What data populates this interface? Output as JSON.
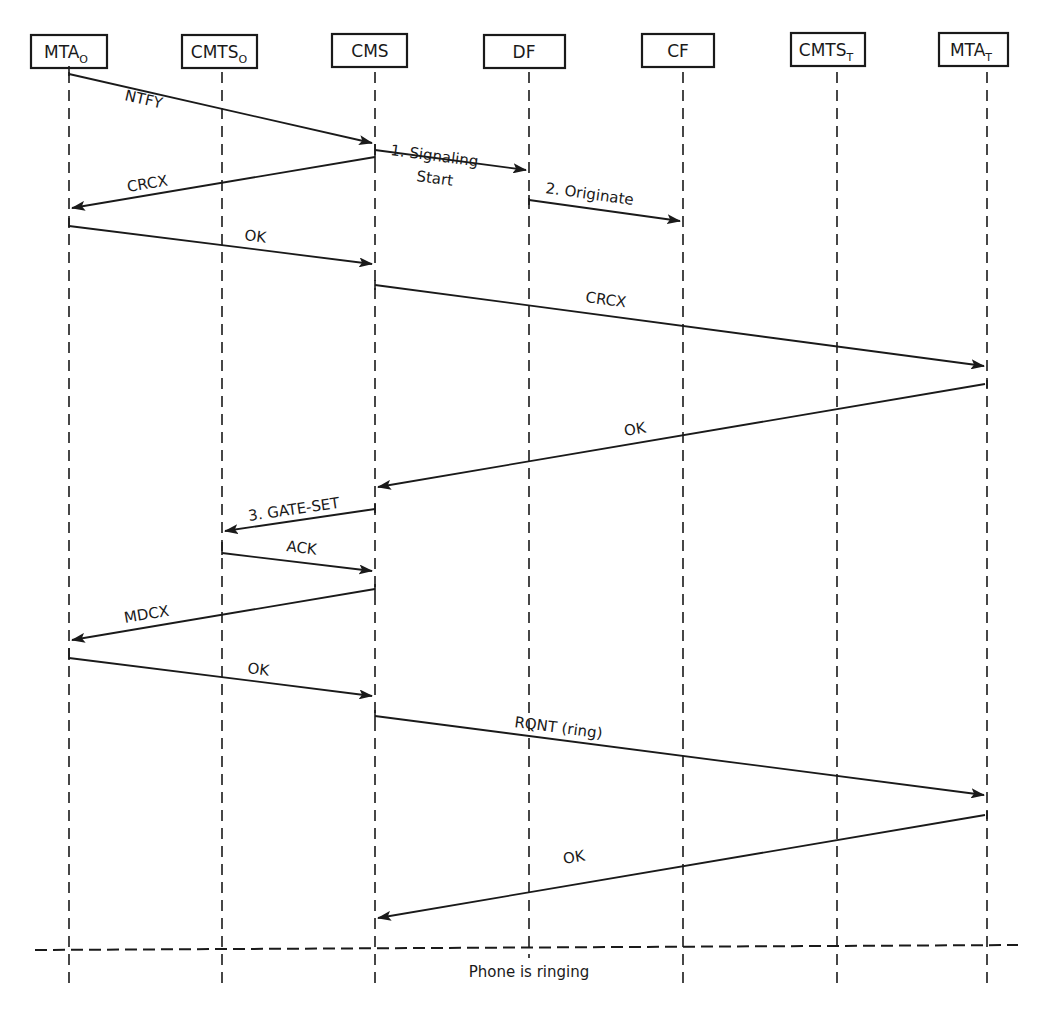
{
  "diagram": {
    "type": "sequence",
    "participants": [
      {
        "id": "mta_o",
        "label": "MTA",
        "sub": "O",
        "x": 69
      },
      {
        "id": "cmts_o",
        "label": "CMTS",
        "sub": "O",
        "x": 222
      },
      {
        "id": "cms",
        "label": "CMS",
        "sub": "",
        "x": 375
      },
      {
        "id": "df",
        "label": "DF",
        "sub": "",
        "x": 529
      },
      {
        "id": "cf",
        "label": "CF",
        "sub": "",
        "x": 683
      },
      {
        "id": "cmts_t",
        "label": "CMTS",
        "sub": "T",
        "x": 837
      },
      {
        "id": "mta_t",
        "label": "MTA",
        "sub": "T",
        "x": 987
      }
    ],
    "messages": [
      {
        "from": "mta_o",
        "to": "cms",
        "label": "NTFY",
        "y1": 74,
        "y2": 143
      },
      {
        "from": "cms",
        "to": "df",
        "label": "1. Signaling",
        "label2": "Start",
        "y1": 150,
        "y2": 170
      },
      {
        "from": "cms",
        "to": "mta_o",
        "label": "CRCX",
        "y1": 157,
        "y2": 208
      },
      {
        "from": "df",
        "to": "cf",
        "label": "2. Originate",
        "y1": 200,
        "y2": 221
      },
      {
        "from": "mta_o",
        "to": "cms",
        "label": "OK",
        "y1": 226,
        "y2": 264
      },
      {
        "from": "cms",
        "to": "mta_t",
        "label": "CRCX",
        "y1": 285,
        "y2": 366
      },
      {
        "from": "mta_t",
        "to": "cms",
        "label": "OK",
        "y1": 384,
        "y2": 487
      },
      {
        "from": "cms",
        "to": "cmts_o",
        "label": "3. GATE-SET",
        "y1": 509,
        "y2": 531
      },
      {
        "from": "cmts_o",
        "to": "cms",
        "label": "ACK",
        "y1": 553,
        "y2": 571
      },
      {
        "from": "cms",
        "to": "mta_o",
        "label": "MDCX",
        "y1": 589,
        "y2": 640
      },
      {
        "from": "mta_o",
        "to": "cms",
        "label": "OK",
        "y1": 658,
        "y2": 696
      },
      {
        "from": "cms",
        "to": "mta_t",
        "label": "RQNT (ring)",
        "y1": 716,
        "y2": 795
      },
      {
        "from": "mta_t",
        "to": "cms",
        "label": "OK",
        "y1": 815,
        "y2": 918
      }
    ],
    "separator": {
      "y": 947,
      "label": "Phone is ringing"
    }
  }
}
